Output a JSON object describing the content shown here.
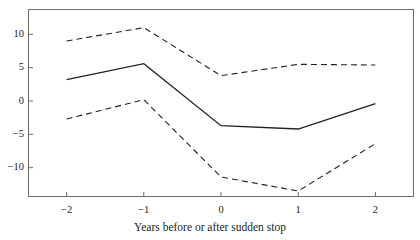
{
  "figure": {
    "caption_remnant": "p",
    "background_color": "#ffffff",
    "frame_color": "#6f6c6c",
    "text_color": "#231f20"
  },
  "chart_data": {
    "type": "line",
    "title": "",
    "subtitle": "",
    "xlabel": "Years before or after sudden stop",
    "ylabel": "",
    "x": [
      -2,
      -1,
      0,
      1,
      2
    ],
    "categories": [
      "-2",
      "-1",
      "0",
      "1",
      "2"
    ],
    "xtick_labels": [
      "−2",
      "−1",
      "0",
      "1",
      "2"
    ],
    "ytick_labels": [
      "10",
      "5",
      "0",
      "−5",
      "−10"
    ],
    "yticks": [
      10,
      5,
      0,
      -5,
      -10
    ],
    "xlim": [
      -2.5,
      2.5
    ],
    "ylim": [
      -14.4,
      13.8
    ],
    "grid": false,
    "legend": "none",
    "series": [
      {
        "name": "Upper confidence band",
        "style": "dashed",
        "color": "#231f20",
        "values": [
          9.0,
          11.0,
          3.8,
          5.5,
          5.4
        ]
      },
      {
        "name": "Point estimate",
        "style": "solid",
        "color": "#231f20",
        "values": [
          3.2,
          5.6,
          -3.7,
          -4.2,
          -0.4
        ]
      },
      {
        "name": "Lower confidence band",
        "style": "dashed",
        "color": "#231f20",
        "values": [
          -2.7,
          0.2,
          -11.4,
          -13.5,
          -6.4
        ]
      }
    ]
  }
}
